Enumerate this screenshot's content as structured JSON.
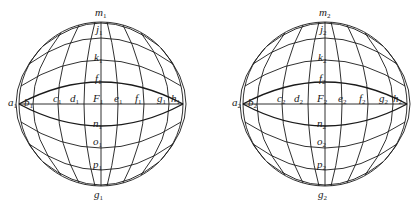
{
  "spheres": [
    {
      "id": 1,
      "center": [
        101,
        104
      ],
      "radius": 82,
      "labels": {
        "top": {
          "base": "m",
          "sub": "1"
        },
        "j": {
          "base": "j",
          "sub": "1"
        },
        "k": {
          "base": "k",
          "sub": "1"
        },
        "f_upper": {
          "base": "f",
          "sub": "1"
        },
        "a": {
          "base": "a",
          "sub": "1"
        },
        "b": {
          "base": "b",
          "sub": "1"
        },
        "c": {
          "base": "c",
          "sub": "1"
        },
        "d": {
          "base": "d",
          "sub": "1"
        },
        "F": {
          "base": "F",
          "sub": "1"
        },
        "e": {
          "base": "e",
          "sub": "1"
        },
        "f_eq": {
          "base": "f",
          "sub": "1"
        },
        "g_eq": {
          "base": "g",
          "sub": "1"
        },
        "h": {
          "base": "h",
          "sub": "1"
        },
        "n": {
          "base": "n",
          "sub": "1"
        },
        "o": {
          "base": "o",
          "sub": "1"
        },
        "p": {
          "base": "p",
          "sub": "1"
        },
        "bottom": {
          "base": "g",
          "sub": "1"
        }
      }
    },
    {
      "id": 2,
      "center": [
        325,
        104
      ],
      "radius": 82,
      "labels": {
        "top": {
          "base": "m",
          "sub": "2"
        },
        "j": {
          "base": "j",
          "sub": "2"
        },
        "k": {
          "base": "k",
          "sub": "2"
        },
        "f_upper": {
          "base": "f",
          "sub": "2"
        },
        "a": {
          "base": "a",
          "sub": "2"
        },
        "b": {
          "base": "b",
          "sub": "2"
        },
        "c": {
          "base": "c",
          "sub": "2"
        },
        "d": {
          "base": "d",
          "sub": "2"
        },
        "F": {
          "base": "F",
          "sub": "2"
        },
        "e": {
          "base": "e",
          "sub": "2"
        },
        "f_eq": {
          "base": "f",
          "sub": "2"
        },
        "g_eq": {
          "base": "g",
          "sub": "2"
        },
        "h": {
          "base": "h",
          "sub": "2"
        },
        "n": {
          "base": "n",
          "sub": "2"
        },
        "o": {
          "base": "o",
          "sub": "2"
        },
        "p": {
          "base": "p",
          "sub": "2"
        },
        "bottom": {
          "base": "g",
          "sub": "2"
        }
      }
    }
  ]
}
